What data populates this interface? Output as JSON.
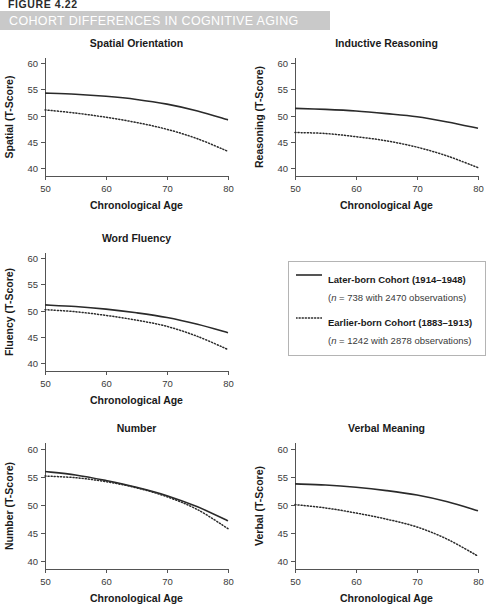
{
  "figure_number": "FIGURE 4.22",
  "banner": {
    "title": "COHORT DIFFERENCES IN COGNITIVE AGING",
    "background_color": "#c9c9c9",
    "text_color": "#ffffff"
  },
  "legend": {
    "position": "middle-right",
    "entries": [
      {
        "style": "solid",
        "label": "Later-born Cohort (1914–1948)",
        "sub_prefix": "(",
        "sub_italic": "n",
        "sub_rest": " = 738 with 2470 observations)"
      },
      {
        "style": "dotted",
        "label": "Earlier-born Cohort (1883–1913)",
        "sub_prefix": "(",
        "sub_italic": "n",
        "sub_rest": " = 1242 with 2878 observations)"
      }
    ]
  },
  "chart_data": [
    {
      "type": "line",
      "title": "Spatial Orientation",
      "xlabel": "Chronological Age",
      "ylabel": "Spatial (T-Score)",
      "x": [
        50,
        55,
        60,
        65,
        70,
        75,
        80
      ],
      "xlim": [
        50,
        80
      ],
      "ylim": [
        38.5,
        61
      ],
      "xticks": [
        50,
        60,
        70,
        80
      ],
      "yticks": [
        40,
        45,
        50,
        55,
        60
      ],
      "grid": false,
      "series": [
        {
          "name": "Later-born Cohort (1914–1948)",
          "style": "solid",
          "values": [
            54.3,
            54.1,
            53.7,
            53.1,
            52.2,
            50.9,
            49.2
          ]
        },
        {
          "name": "Earlier-born Cohort (1883–1913)",
          "style": "dotted",
          "values": [
            51.1,
            50.5,
            49.7,
            48.7,
            47.4,
            45.6,
            43.2
          ]
        }
      ]
    },
    {
      "type": "line",
      "title": "Inductive Reasoning",
      "xlabel": "Chronological Age",
      "ylabel": "Reasoning (T-Score)",
      "x": [
        50,
        55,
        60,
        65,
        70,
        75,
        80
      ],
      "xlim": [
        50,
        80
      ],
      "ylim": [
        38.5,
        61
      ],
      "xticks": [
        50,
        60,
        70,
        80
      ],
      "yticks": [
        40,
        45,
        50,
        55,
        60
      ],
      "grid": false,
      "series": [
        {
          "name": "Later-born Cohort (1914–1948)",
          "style": "solid",
          "values": [
            51.4,
            51.2,
            50.9,
            50.4,
            49.8,
            48.8,
            47.6
          ]
        },
        {
          "name": "Earlier-born Cohort (1883–1913)",
          "style": "dotted",
          "values": [
            46.8,
            46.6,
            46.0,
            45.2,
            44.0,
            42.3,
            40.1
          ]
        }
      ]
    },
    {
      "type": "line",
      "title": "Word Fluency",
      "xlabel": "Chronological Age",
      "ylabel": "Fluency (T-Score)",
      "x": [
        50,
        55,
        60,
        65,
        70,
        75,
        80
      ],
      "xlim": [
        50,
        80
      ],
      "ylim": [
        38.5,
        61
      ],
      "xticks": [
        50,
        60,
        70,
        80
      ],
      "yticks": [
        40,
        45,
        50,
        55,
        60
      ],
      "grid": false,
      "series": [
        {
          "name": "Later-born Cohort (1914–1948)",
          "style": "solid",
          "values": [
            51.1,
            50.8,
            50.3,
            49.6,
            48.7,
            47.4,
            45.8
          ]
        },
        {
          "name": "Earlier-born Cohort (1883–1913)",
          "style": "dotted",
          "values": [
            50.2,
            49.8,
            49.1,
            48.2,
            47.0,
            45.1,
            42.6
          ]
        }
      ]
    },
    {
      "type": "line",
      "title": "Number",
      "xlabel": "Chronological Age",
      "ylabel": "Number (T-Score)",
      "x": [
        50,
        55,
        60,
        65,
        70,
        75,
        80
      ],
      "xlim": [
        50,
        80
      ],
      "ylim": [
        38.5,
        61
      ],
      "xticks": [
        50,
        60,
        70,
        80
      ],
      "yticks": [
        40,
        45,
        50,
        55,
        60
      ],
      "grid": false,
      "series": [
        {
          "name": "Later-born Cohort (1914–1948)",
          "style": "solid",
          "values": [
            55.9,
            55.3,
            54.3,
            53.1,
            51.6,
            49.6,
            47.1
          ]
        },
        {
          "name": "Earlier-born Cohort (1883–1913)",
          "style": "dotted",
          "values": [
            55.1,
            54.8,
            54.1,
            53.0,
            51.4,
            49.1,
            45.7
          ]
        }
      ]
    },
    {
      "type": "line",
      "title": "Verbal Meaning",
      "xlabel": "Chronological Age",
      "ylabel": "Verbal (T-Score)",
      "x": [
        50,
        55,
        60,
        65,
        70,
        75,
        80
      ],
      "xlim": [
        50,
        80
      ],
      "ylim": [
        38.5,
        61
      ],
      "xticks": [
        50,
        60,
        70,
        80
      ],
      "yticks": [
        40,
        45,
        50,
        55,
        60
      ],
      "grid": false,
      "series": [
        {
          "name": "Later-born Cohort (1914–1948)",
          "style": "solid",
          "values": [
            53.7,
            53.5,
            53.1,
            52.5,
            51.7,
            50.5,
            48.9
          ]
        },
        {
          "name": "Earlier-born Cohort (1883–1913)",
          "style": "dotted",
          "values": [
            50.0,
            49.4,
            48.5,
            47.4,
            46.0,
            43.8,
            40.8
          ]
        }
      ]
    }
  ]
}
